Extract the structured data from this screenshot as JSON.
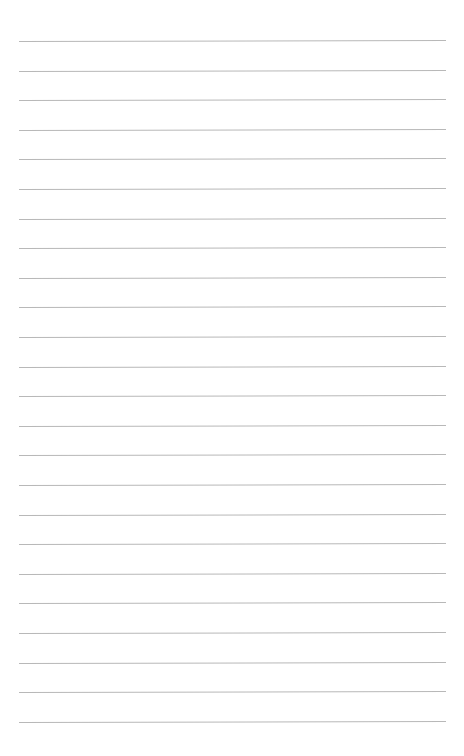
{
  "page": {
    "type": "lined-paper",
    "background": "#ffffff",
    "line_color": "#b8b8b8",
    "line_count": 24,
    "first_line_y": 41,
    "line_spacing": 29.6,
    "line_left": 19,
    "line_width": 427
  }
}
